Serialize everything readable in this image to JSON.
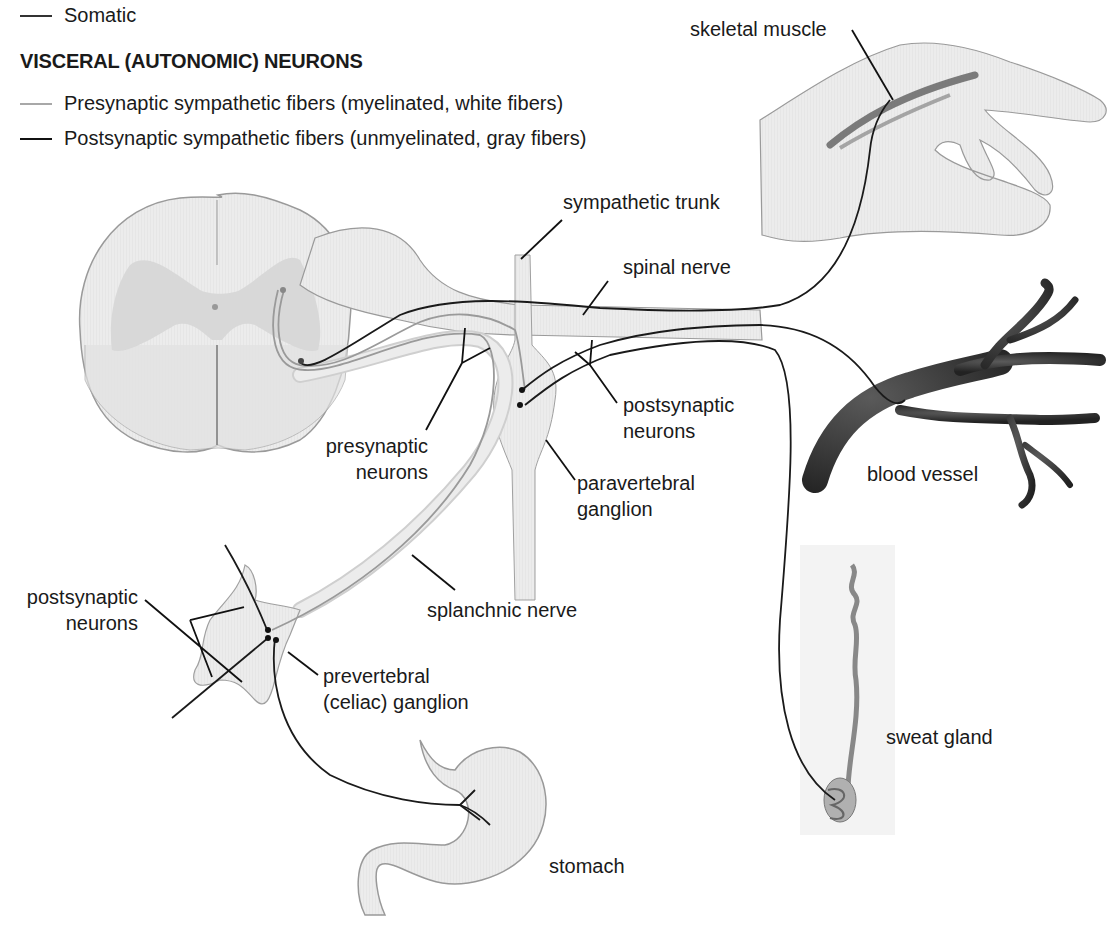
{
  "legend": {
    "somatic": {
      "label": "Somatic",
      "color": "#333333"
    },
    "heading": "VISCERAL (AUTONOMIC) NEURONS",
    "presynaptic": {
      "label": "Presynaptic sympathetic fibers (myelinated, white fibers)",
      "color": "#a8a8a8"
    },
    "postsynaptic": {
      "label": "Postsynaptic sympathetic fibers (unmyelinated, gray fibers)",
      "color": "#111111"
    }
  },
  "labels": {
    "skeletal_muscle": "skeletal muscle",
    "sympathetic_trunk": "sympathetic trunk",
    "spinal_nerve": "spinal nerve",
    "postsynaptic_neurons_upper_1": "postsynaptic",
    "postsynaptic_neurons_upper_2": "neurons",
    "presynaptic_neurons_1": "presynaptic",
    "presynaptic_neurons_2": "neurons",
    "paravertebral_ganglion_1": "paravertebral",
    "paravertebral_ganglion_2": "ganglion",
    "blood_vessel": "blood vessel",
    "postsynaptic_neurons_lower_1": "postsynaptic",
    "postsynaptic_neurons_lower_2": "neurons",
    "splanchnic_nerve": "splanchnic nerve",
    "prevertebral_ganglion_1": "prevertebral",
    "prevertebral_ganglion_2": "(celiac) ganglion",
    "sweat_gland": "sweat gland",
    "stomach": "stomach"
  },
  "colors": {
    "tissue_fill": "#ececec",
    "tissue_stroke": "#9a9a9a",
    "gray_matter": "#d6d6d6",
    "blood_vessel": "#3a3a3a",
    "leader_line": "#111111"
  }
}
